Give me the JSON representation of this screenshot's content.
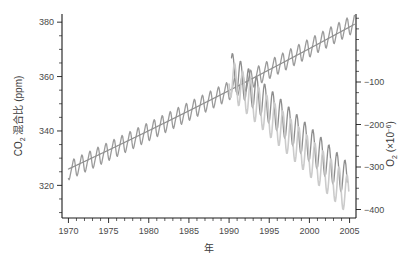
{
  "chart_data": {
    "type": "line",
    "title": "",
    "xlabel": "年",
    "ylabel": "CO₂ 混合比 (ppm)",
    "y2label": "O₂ (×10⁻⁶)",
    "grid": false,
    "legend": "none",
    "xlim": [
      1969.2,
      2005.8
    ],
    "ylim": [
      308,
      383
    ],
    "y2lim": [
      -420,
      60
    ],
    "xticks": [
      1970,
      1975,
      1980,
      1985,
      1990,
      1995,
      2000,
      2005
    ],
    "xtick_labels": [
      "1970",
      "1975",
      "1980",
      "1985",
      "1990",
      "1995",
      "2000",
      "2005"
    ],
    "xminor_step": 1,
    "yticks": [
      320,
      340,
      360,
      380
    ],
    "ytick_labels": [
      "320",
      "340",
      "360",
      "380"
    ],
    "yminor_step": 5,
    "y2ticks": [
      -100,
      -200,
      -300,
      -400
    ],
    "y2tick_labels": [
      "−100",
      "−200",
      "−300",
      "−400"
    ],
    "y2minor_step": 25,
    "series": [
      {
        "name": "CO₂ 混合比",
        "axis": "left",
        "color": "#9a9a9a",
        "width": 1.3,
        "x_start": 1970.0,
        "x_end": 2005.6,
        "samples_per_year": 12,
        "trend": {
          "value_at_start": 325.4,
          "value_at_end": 379.6,
          "curvature": 0.0065
        },
        "seasonal_amplitude": 3.2,
        "seasonal_phase": 0.38,
        "seasonal_sharpness": 0.42
      },
      {
        "name": "CO₂ 平滑トレンド",
        "axis": "left",
        "color": "#8f8f8f",
        "width": 1.2,
        "x_start": 1970.0,
        "x_end": 2005.6,
        "samples_per_year": 12,
        "trend": {
          "value_at_start": 326.0,
          "value_at_end": 379.2,
          "curvature": 0.0065
        },
        "seasonal_amplitude": 0.0,
        "seasonal_phase": 0.0,
        "seasonal_sharpness": 0.0
      },
      {
        "name": "O₂ (系列1)",
        "axis": "right",
        "color": "#8d8d8d",
        "width": 1.3,
        "x_start": 1990.3,
        "x_end": 2004.7,
        "samples_per_year": 12,
        "trend": {
          "value_at_start": -72,
          "value_at_end": -330,
          "curvature": 0.0
        },
        "seasonal_amplitude": 42,
        "seasonal_phase": 0.18,
        "seasonal_sharpness": 0.0
      },
      {
        "name": "O₂ (系列2)",
        "axis": "right",
        "color": "#cbcbcb",
        "width": 1.6,
        "x_start": 1990.0,
        "x_end": 2004.9,
        "samples_per_year": 12,
        "trend": {
          "value_at_start": -88,
          "value_at_end": -368,
          "curvature": 0.0
        },
        "seasonal_amplitude": 46,
        "seasonal_phase": 0.44,
        "seasonal_sharpness": 0.0
      }
    ]
  },
  "layout": {
    "plot_left": 62,
    "plot_right": 356,
    "plot_top": 14,
    "plot_bottom": 218
  },
  "labels": {
    "y_axis_main": "CO",
    "y_axis_sub": "2",
    "y_axis_rest": " 混合比 (ppm)",
    "y2_axis_main": "O",
    "y2_axis_sub": "2",
    "y2_axis_rest": " (×10",
    "y2_axis_exp": "−6",
    "y2_axis_close": ")",
    "x_axis": "年"
  }
}
